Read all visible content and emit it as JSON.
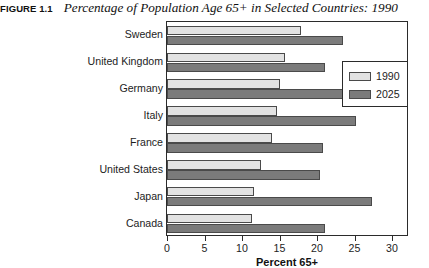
{
  "figure": {
    "number": "FIGURE 1.1",
    "title": "Percentage of Population Age 65+ in Selected Countries: 1990"
  },
  "chart_data": {
    "type": "bar",
    "orientation": "horizontal",
    "title": "Percentage of Population Age 65+ in Selected Countries: 1990",
    "xlabel": "Percent 65+",
    "ylabel": "",
    "xlim": [
      0,
      32
    ],
    "xticks": [
      0,
      5,
      10,
      15,
      20,
      25,
      30
    ],
    "xtick_labels": [
      "0",
      "5",
      "10",
      "15",
      "20",
      "25",
      "30"
    ],
    "grid": false,
    "legend_position": "upper right",
    "categories": [
      "Sweden",
      "United Kingdom",
      "Germany",
      "Italy",
      "France",
      "United States",
      "Japan",
      "Canada"
    ],
    "series": [
      {
        "name": "1990",
        "color": "#e2e2e2",
        "values": [
          17.9,
          15.7,
          15.0,
          14.7,
          14.0,
          12.5,
          11.6,
          11.3
        ]
      },
      {
        "name": "2025",
        "color": "#7b7b7b",
        "values": [
          23.5,
          21.1,
          24.5,
          25.2,
          20.8,
          20.4,
          27.3,
          21.0
        ]
      }
    ]
  },
  "legend": {
    "entries": [
      {
        "label": "1990",
        "color": "#e2e2e2"
      },
      {
        "label": "2025",
        "color": "#7b7b7b"
      }
    ]
  }
}
